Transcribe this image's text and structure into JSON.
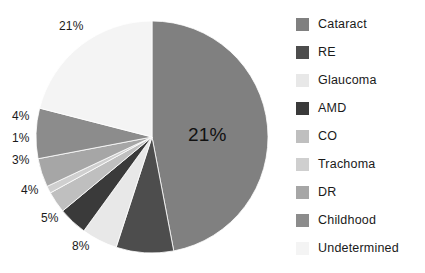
{
  "chart_data": {
    "type": "pie",
    "title": "",
    "subtitle": "",
    "xlabel": "",
    "ylabel": "",
    "legend_position": "right",
    "grid": false,
    "start_angle_deg": 0,
    "direction": "clockwise",
    "categories": [
      "Cataract",
      "RE",
      "Glaucoma",
      "AMD",
      "CO",
      "Trachoma",
      "DR",
      "Childhood",
      "Undetermined"
    ],
    "values": [
      47,
      8,
      5,
      4,
      3,
      1,
      4,
      7,
      21
    ],
    "data_labels": [
      "21%",
      "8%",
      "5%",
      "4%",
      "3%",
      "1%",
      "4%",
      "",
      "21%"
    ],
    "colors": [
      "#808080",
      "#4d4d4d",
      "#e8e8e8",
      "#3a3a3a",
      "#bfbfbf",
      "#cfcfcf",
      "#a6a6a6",
      "#8c8c8c",
      "#f4f4f4"
    ],
    "slices": [
      {
        "label": "Cataract",
        "value": 47,
        "data_label": "21%",
        "color": "#808080"
      },
      {
        "label": "RE",
        "value": 8,
        "data_label": "8%",
        "color": "#4d4d4d"
      },
      {
        "label": "Glaucoma",
        "value": 5,
        "data_label": "5%",
        "color": "#e8e8e8"
      },
      {
        "label": "AMD",
        "value": 4,
        "data_label": "4%",
        "color": "#3a3a3a"
      },
      {
        "label": "CO",
        "value": 3,
        "data_label": "3%",
        "color": "#bfbfbf"
      },
      {
        "label": "Trachoma",
        "value": 1,
        "data_label": "1%",
        "color": "#cfcfcf"
      },
      {
        "label": "DR",
        "value": 4,
        "data_label": "4%",
        "color": "#a6a6a6"
      },
      {
        "label": "Childhood",
        "value": 7,
        "data_label": "",
        "color": "#8c8c8c"
      },
      {
        "label": "Undetermined",
        "value": 21,
        "data_label": "21%",
        "color": "#f4f4f4"
      }
    ]
  },
  "labels": {
    "cataract_pct": "21%",
    "re_pct": "8%",
    "glaucoma_pct": "5%",
    "amd_pct": "4%",
    "co_pct": "3%",
    "trachoma_pct": "1%",
    "dr_pct": "4%",
    "undetermined_pct": "21%"
  },
  "legend": {
    "items": [
      {
        "label": "Cataract",
        "color": "#808080"
      },
      {
        "label": "RE",
        "color": "#4d4d4d"
      },
      {
        "label": "Glaucoma",
        "color": "#e8e8e8"
      },
      {
        "label": "AMD",
        "color": "#3a3a3a"
      },
      {
        "label": "CO",
        "color": "#bfbfbf"
      },
      {
        "label": "Trachoma",
        "color": "#cfcfcf"
      },
      {
        "label": "DR",
        "color": "#a6a6a6"
      },
      {
        "label": "Childhood",
        "color": "#8c8c8c"
      },
      {
        "label": "Undetermined",
        "color": "#f4f4f4"
      }
    ]
  }
}
